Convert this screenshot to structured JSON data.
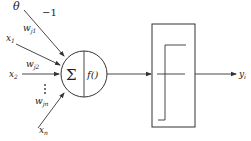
{
  "diagram": {
    "type": "neuron-model",
    "inputs": [
      {
        "name": "theta",
        "label": "θ",
        "weight_label": "−1"
      },
      {
        "name": "x1",
        "label": "x",
        "sub": "1",
        "weight_label": "w",
        "weight_sub": "j1"
      },
      {
        "name": "x2",
        "label": "x",
        "sub": "2",
        "weight_label": "w",
        "weight_sub": "j2"
      },
      {
        "name": "xn",
        "label": "x",
        "sub": "n",
        "weight_label": "w",
        "weight_sub": "jn"
      }
    ],
    "ellipsis": "⋮",
    "summation_symbol": "Σ",
    "activation_label": "f()",
    "output": {
      "label": "y",
      "sub": "i"
    },
    "colors": {
      "stroke": "#333333",
      "background": "#ffffff"
    }
  }
}
